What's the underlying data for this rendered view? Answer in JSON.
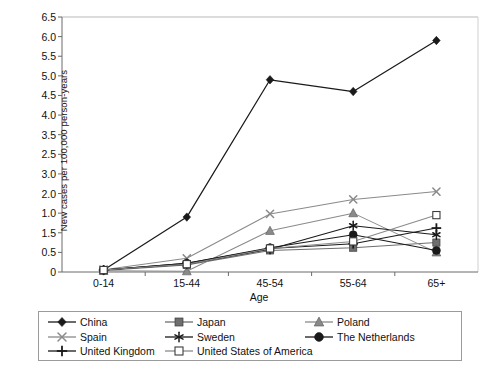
{
  "chart_data": {
    "type": "line",
    "title": "",
    "xlabel": "Age",
    "ylabel": "New cases per 100,000 person-years",
    "categories": [
      "0-14",
      "15-44",
      "45-54",
      "55-64",
      "65+"
    ],
    "ylim": [
      0,
      6.5
    ],
    "ytick_labels": [
      "6.5",
      "6.0",
      "5.5",
      "5.0",
      "4.5",
      "4.0",
      "3.5",
      "2.5",
      "3.0",
      "2.0",
      "1.0",
      "1.5",
      "0.5",
      "0"
    ],
    "ytick_values": [
      6.5,
      6.0,
      5.5,
      5.0,
      4.5,
      4.0,
      3.5,
      3.0,
      2.5,
      2.0,
      1.5,
      1.0,
      0.5,
      0
    ],
    "grid": false,
    "legend_position": "bottom",
    "series": [
      {
        "name": "China",
        "marker": "filled-diamond",
        "color": "#1a1a1a",
        "values": [
          0.05,
          1.4,
          4.9,
          4.6,
          5.9
        ]
      },
      {
        "name": "Japan",
        "marker": "filled-square",
        "color": "#6e6e6e",
        "values": [
          0.04,
          0.18,
          0.55,
          0.62,
          0.75
        ]
      },
      {
        "name": "Poland",
        "marker": "filled-triangle",
        "color": "#8a8a8a",
        "values": [
          0.03,
          0.02,
          1.05,
          1.5,
          0.5
        ]
      },
      {
        "name": "Spain",
        "marker": "cross-x",
        "color": "#8a8a8a",
        "values": [
          0.06,
          0.35,
          1.48,
          1.85,
          2.05
        ]
      },
      {
        "name": "Sweden",
        "marker": "asterisk",
        "color": "#1a1a1a",
        "values": [
          0.05,
          0.2,
          0.58,
          1.18,
          0.95
        ]
      },
      {
        "name": "The Netherlands",
        "marker": "filled-circle",
        "color": "#1a1a1a",
        "values": [
          0.05,
          0.22,
          0.62,
          0.95,
          0.55
        ]
      },
      {
        "name": "United Kingdom",
        "marker": "plus",
        "color": "#1a1a1a",
        "values": [
          0.05,
          0.22,
          0.6,
          0.72,
          1.12
        ]
      },
      {
        "name": "United States of America",
        "marker": "open-square",
        "color": "#8a8a8a",
        "values": [
          0.05,
          0.2,
          0.6,
          0.78,
          1.45
        ]
      }
    ]
  },
  "axis": {
    "y_title": "New cases per 100,000 person-years",
    "x_title": "Age"
  },
  "legend": {
    "rows": [
      [
        {
          "label": "China",
          "marker": "filled-diamond",
          "color": "#1a1a1a"
        },
        {
          "label": "Japan",
          "marker": "filled-square",
          "color": "#6e6e6e"
        },
        {
          "label": "Poland",
          "marker": "filled-triangle",
          "color": "#8a8a8a"
        }
      ],
      [
        {
          "label": "Spain",
          "marker": "cross-x",
          "color": "#8a8a8a"
        },
        {
          "label": "Sweden",
          "marker": "asterisk",
          "color": "#1a1a1a"
        },
        {
          "label": "The Netherlands",
          "marker": "filled-circle",
          "color": "#1a1a1a"
        }
      ],
      [
        {
          "label": "United Kingdom",
          "marker": "plus",
          "color": "#1a1a1a"
        },
        {
          "label": "United States of America",
          "marker": "open-square",
          "color": "#8a8a8a"
        }
      ]
    ]
  }
}
